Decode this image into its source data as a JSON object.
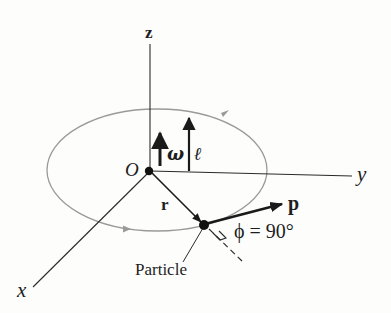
{
  "diagram": {
    "type": "angular-momentum-of-particle",
    "colors": {
      "background": "#fdfdfc",
      "axes": "#2a2a2a",
      "orbit": "#9a9a9a",
      "vectors": "#1a1a1a",
      "text": "#1e1e1e"
    },
    "axes": {
      "z_label": "z",
      "y_label": "y",
      "x_label": "x"
    },
    "origin": {
      "label": "O"
    },
    "vectors": {
      "angular_velocity": {
        "symbol": "ω",
        "direction": "+z"
      },
      "angular_momentum": {
        "symbol": "ℓ",
        "direction": "+z"
      },
      "position": {
        "symbol": "r",
        "from": "origin",
        "to": "particle"
      },
      "momentum": {
        "symbol": "p",
        "from": "particle",
        "direction": "tangent to orbit"
      }
    },
    "angle": {
      "symbol": "ϕ",
      "equals": "=",
      "value": "90°",
      "full_text": "ϕ = 90°"
    },
    "particle": {
      "label": "Particle"
    },
    "orbit": {
      "shape": "circle (drawn as ellipse in perspective)",
      "direction": "counterclockwise viewed from +z"
    }
  }
}
